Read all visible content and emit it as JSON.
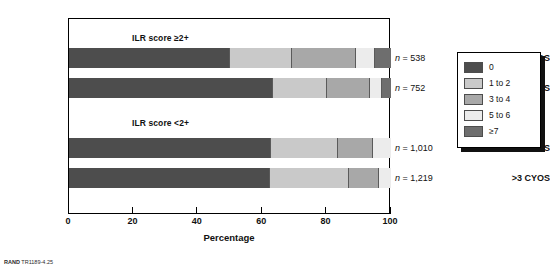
{
  "footer": {
    "brand": "RAND",
    "figure_id": "TR1189-4.25"
  },
  "axis": {
    "x_title": "Percentage",
    "ticks": [
      "0",
      "20",
      "40",
      "60",
      "80",
      "100"
    ]
  },
  "legend": {
    "items": [
      {
        "label": "0",
        "color": "#4d4d4d"
      },
      {
        "label": "1 to 2",
        "color": "#c9c9c9"
      },
      {
        "label": "3 to 4",
        "color": "#a8a8a8"
      },
      {
        "label": "5 to 6",
        "color": "#ececec"
      },
      {
        "label": "≥7",
        "color": "#6e6e6e"
      }
    ]
  },
  "groups": [
    {
      "title": "ILR score ≥2+"
    },
    {
      "title": "ILR score <2+"
    }
  ],
  "rows": [
    {
      "category": "≤3 CYOS",
      "n_label": "n = 538",
      "n_value": 538
    },
    {
      "category": ">3 CYOS",
      "n_label": "n = 752",
      "n_value": 752
    },
    {
      "category": "≤3 CYOS",
      "n_label": "n = 1,010",
      "n_value": 1010
    },
    {
      "category": ">3 CYOS",
      "n_label": "n = 1,219",
      "n_value": 1219
    }
  ],
  "chart_data": {
    "type": "bar",
    "orientation": "horizontal",
    "stacked": true,
    "stack_unit": "percent",
    "title": "",
    "xlabel": "Percentage",
    "ylabel": "",
    "xlim": [
      0,
      100
    ],
    "xticks": [
      0,
      20,
      40,
      60,
      80,
      100
    ],
    "grid": false,
    "legend_position": "right-outside",
    "legend_title": "",
    "categories": [
      "ILR score ≥2+ / ≤3 CYOS",
      "ILR score ≥2+ / >3 CYOS",
      "ILR score <2+ / ≤3 CYOS",
      "ILR score <2+ / >3 CYOS"
    ],
    "annotations": [
      "ILR score ≥2+",
      "ILR score <2+",
      "n = 538",
      "n = 752",
      "n = 1,010",
      "n = 1,219"
    ],
    "series": [
      {
        "name": "0",
        "color": "#4d4d4d",
        "values": [
          50.0,
          63.4,
          62.7,
          62.4
        ]
      },
      {
        "name": "1 to 2",
        "color": "#c9c9c9",
        "values": [
          19.3,
          16.8,
          20.8,
          24.5
        ]
      },
      {
        "name": "3 to 4",
        "color": "#a8a8a8",
        "values": [
          19.9,
          13.4,
          10.9,
          9.3
        ]
      },
      {
        "name": "5 to 6",
        "color": "#ececec",
        "values": [
          5.9,
          3.7,
          5.6,
          3.8
        ]
      },
      {
        "name": "≥7",
        "color": "#6e6e6e",
        "values": [
          4.9,
          2.7,
          0.0,
          0.0
        ]
      }
    ]
  }
}
